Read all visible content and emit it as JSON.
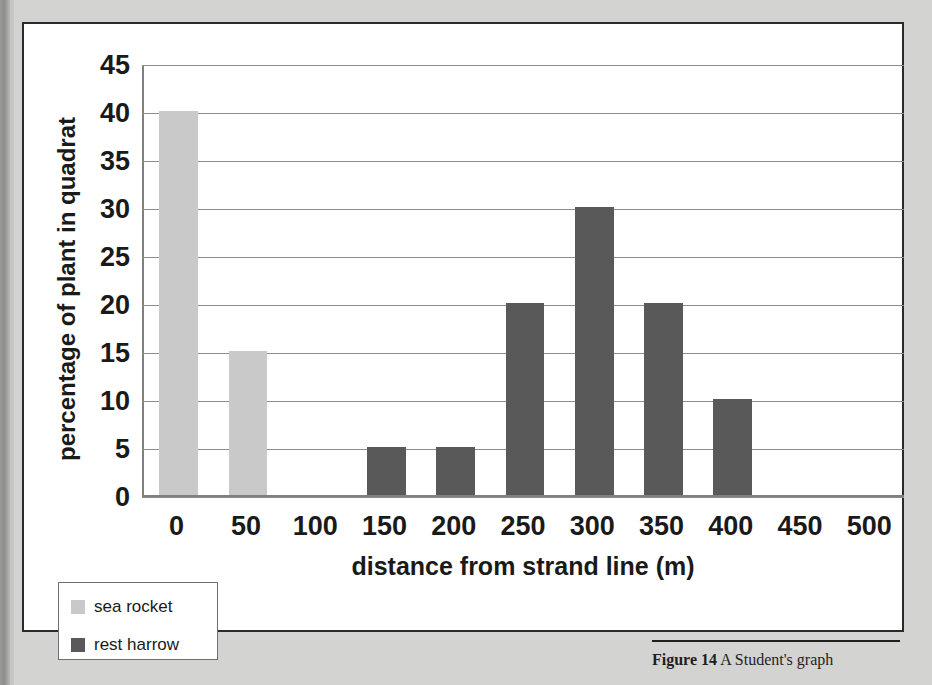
{
  "figure": {
    "cut_off_title": "",
    "caption_bold": "Figure 14",
    "caption_rest": " A Student's graph"
  },
  "legend": {
    "items": [
      {
        "label": "sea rocket",
        "color": "#c9c9c9"
      },
      {
        "label": "rest harrow",
        "color": "#595959"
      }
    ]
  },
  "chart_data": {
    "type": "bar",
    "title": "",
    "xlabel": "distance from strand line (m)",
    "ylabel": "percentage of plant in quadrat",
    "categories": [
      "0",
      "50",
      "100",
      "150",
      "200",
      "250",
      "300",
      "350",
      "400",
      "450",
      "500"
    ],
    "yticks": [
      "0",
      "5",
      "10",
      "15",
      "20",
      "25",
      "30",
      "35",
      "40",
      "45"
    ],
    "ylim": [
      0,
      45
    ],
    "grid": true,
    "legend_position": "bottom-left",
    "series": [
      {
        "name": "sea rocket",
        "color": "#c9c9c9",
        "values": [
          40,
          15,
          0,
          0,
          0,
          0,
          0,
          0,
          0,
          0,
          0
        ]
      },
      {
        "name": "rest harrow",
        "color": "#595959",
        "values": [
          0,
          0,
          0,
          5,
          5,
          20,
          30,
          20,
          10,
          0,
          0
        ]
      }
    ]
  }
}
